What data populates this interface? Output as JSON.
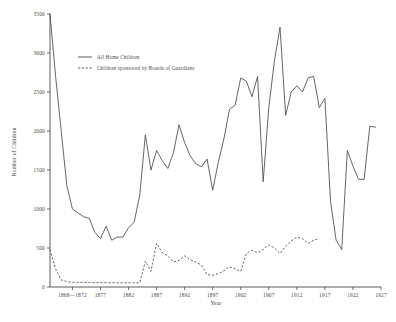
{
  "chart_data": {
    "type": "line",
    "title": "",
    "xlabel": "Year",
    "ylabel": "Number of Children",
    "grid": false,
    "legend_position": "top-left",
    "xlim": [
      1868,
      1927
    ],
    "ylim": [
      0,
      3500
    ],
    "ytick_labels": [
      "0",
      "500",
      "1000",
      "1500",
      "2000",
      "2500",
      "3000",
      "3500"
    ],
    "ytick_values": [
      0,
      500,
      1000,
      1500,
      2000,
      2500,
      3000,
      3500
    ],
    "xtick_labels": [
      "1868—1872",
      "1877",
      "1882",
      "1887",
      "1892",
      "1897",
      "1902",
      "1907",
      "1912",
      "1917",
      "1922",
      "1927"
    ],
    "xtick_values": [
      1872,
      1877,
      1882,
      1887,
      1892,
      1897,
      1902,
      1907,
      1912,
      1917,
      1922,
      1927
    ],
    "series": [
      {
        "name": "All Home Children",
        "style": "solid",
        "x": [
          1868,
          1869,
          1870,
          1871,
          1872,
          1873,
          1874,
          1875,
          1876,
          1877,
          1878,
          1879,
          1880,
          1881,
          1882,
          1883,
          1884,
          1885,
          1886,
          1887,
          1888,
          1889,
          1890,
          1891,
          1892,
          1893,
          1894,
          1895,
          1896,
          1897,
          1898,
          1899,
          1900,
          1901,
          1902,
          1903,
          1904,
          1905,
          1906,
          1907,
          1908,
          1909,
          1910,
          1911,
          1912,
          1913,
          1914,
          1915,
          1916,
          1917,
          1918,
          1919,
          1920,
          1921,
          1922,
          1923,
          1924,
          1925,
          1926
        ],
        "values": [
          3500,
          2700,
          2000,
          1300,
          1000,
          950,
          900,
          880,
          700,
          620,
          780,
          600,
          640,
          640,
          760,
          830,
          1180,
          1950,
          1500,
          1750,
          1620,
          1520,
          1720,
          2080,
          1850,
          1680,
          1580,
          1540,
          1640,
          1240,
          1600,
          1900,
          2280,
          2330,
          2680,
          2640,
          2440,
          2700,
          1350,
          2300,
          2900,
          3330,
          2200,
          2500,
          2580,
          2500,
          2680,
          2700,
          2300,
          2420,
          1100,
          600,
          480,
          1750,
          1550,
          1380,
          1380,
          2060,
          2050
        ],
        "peak_value": 3330,
        "peak_year": 1913
      },
      {
        "name": "Children sponsored by Boards of Guardians",
        "style": "dashed",
        "x": [
          1868,
          1869,
          1870,
          1871,
          1872,
          1873,
          1874,
          1875,
          1876,
          1877,
          1878,
          1879,
          1880,
          1881,
          1882,
          1883,
          1884,
          1885,
          1886,
          1887,
          1888,
          1889,
          1890,
          1891,
          1892,
          1893,
          1894,
          1895,
          1896,
          1897,
          1898,
          1899,
          1900,
          1901,
          1902,
          1903,
          1904,
          1905,
          1906,
          1907,
          1908,
          1909,
          1910,
          1911,
          1912,
          1913,
          1914,
          1915,
          1916
        ],
        "values": [
          480,
          230,
          90,
          70,
          60,
          60,
          58,
          58,
          56,
          56,
          55,
          55,
          54,
          54,
          54,
          54,
          54,
          330,
          200,
          560,
          440,
          400,
          320,
          340,
          400,
          350,
          320,
          280,
          160,
          150,
          170,
          210,
          260,
          230,
          200,
          430,
          470,
          440,
          480,
          540,
          500,
          430,
          520,
          590,
          640,
          620,
          560,
          600,
          620
        ],
        "peak_value": 640,
        "peak_year": 1912
      }
    ]
  },
  "legend": {
    "entries": [
      {
        "label": "All Home Children",
        "style": "solid"
      },
      {
        "label": "Children sponsored by Boards of Guardians",
        "style": "dashed"
      }
    ]
  },
  "axes": {
    "x_title": "Year",
    "y_title": "Number of Children"
  }
}
